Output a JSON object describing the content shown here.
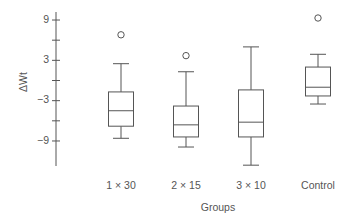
{
  "chart_data": {
    "type": "box",
    "title": "",
    "xlabel": "Groups",
    "ylabel": "ΔWt",
    "ylim": [
      -13,
      10.5
    ],
    "yticks": [
      9,
      6,
      3,
      0,
      -3,
      -6,
      -9
    ],
    "ytick_labels": [
      "9",
      "",
      "3",
      "",
      "−3",
      "",
      "−9"
    ],
    "grid": false,
    "categories": [
      "1 × 30",
      "2 × 15",
      "3 × 10",
      "Control"
    ],
    "series": [
      {
        "name": "1 × 30",
        "whisker_low": -8.6,
        "q1": -6.8,
        "median": -4.5,
        "q3": -1.7,
        "whisker_high": 2.5,
        "outliers": [
          6.8
        ]
      },
      {
        "name": "2 × 15",
        "whisker_low": -9.9,
        "q1": -8.4,
        "median": -6.6,
        "q3": -3.8,
        "whisker_high": 1.3,
        "outliers": [
          3.7
        ]
      },
      {
        "name": "3 × 10",
        "whisker_low": -12.6,
        "q1": -8.4,
        "median": -6.2,
        "q3": -1.4,
        "whisker_high": 5.0,
        "outliers": []
      },
      {
        "name": "Control",
        "whisker_low": -3.5,
        "q1": -2.3,
        "median": -1.0,
        "q3": 2.0,
        "whisker_high": 3.9,
        "outliers": [
          9.3
        ]
      }
    ]
  },
  "colors": {
    "stroke": "#555555",
    "background": "#ffffff"
  }
}
